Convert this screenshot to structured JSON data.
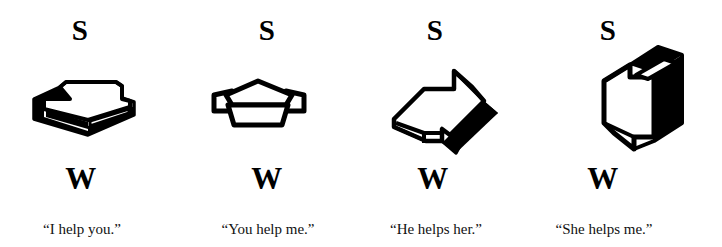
{
  "figure": {
    "background_color": "#ffffff",
    "ink_color": "#000000",
    "panel_count": 4
  },
  "panels": [
    {
      "top_label": "S",
      "bottom_label": "W",
      "caption": "“I help you.”",
      "shape_name": "block-shape-flat-open-box",
      "shape_description": "flat open box with thick black left and front faces, white top face, viewed from a shallow angle"
    },
    {
      "top_label": "S",
      "bottom_label": "W",
      "caption": "“You help me.”",
      "shape_name": "block-shape-tilted-trapezoid-box",
      "shape_description": "box rotated so the top face reads as a trapezoid with small side tabs, outlined in heavy black with white interior"
    },
    {
      "top_label": "S",
      "bottom_label": "W",
      "caption": "“He helps her.”",
      "shape_name": "block-shape-rotated-arrow-box",
      "shape_description": "box rotated further, white outlined body with a solid black wedge face on the lower right"
    },
    {
      "top_label": "S",
      "bottom_label": "W",
      "caption": "“She helps me.”",
      "shape_name": "block-shape-upright-arrow-box",
      "shape_description": "box rotated to an upright orientation, white front face with a solid black right side face and black top edge"
    }
  ]
}
